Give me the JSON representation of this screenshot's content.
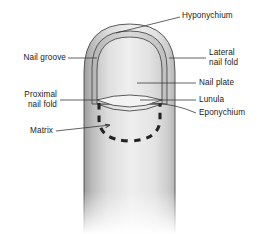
{
  "figure": {
    "title": "",
    "background_color": "#ffffff",
    "line_color": "#3a3a3a",
    "finger_fill_light": "#efefef",
    "finger_fill_mid": "#d5d5d5",
    "finger_fill_shadow": "#9a9a9a",
    "nail_plate_fill": "#e4e4e4",
    "lunula_fill": "#f2f2f2",
    "dashed_matrix_color": "#2b2b2b"
  },
  "labels": {
    "hyponychium": "Hyponychium",
    "nail_groove": "Nail groove",
    "lateral_nail_fold": "Lateral\nnail fold",
    "nail_plate": "Nail plate",
    "lunula": "Lunula",
    "eponychium": "Eponychium",
    "proximal_nail_fold": "Proximal\nnail fold",
    "matrix": "Matrix"
  },
  "label_list": [
    {
      "key": "hyponychium",
      "text": "Hyponychium",
      "side": "right"
    },
    {
      "key": "lateral_nail_fold",
      "text": "Lateral nail fold",
      "side": "right"
    },
    {
      "key": "nail_plate",
      "text": "Nail plate",
      "side": "right"
    },
    {
      "key": "lunula",
      "text": "Lunula",
      "side": "right"
    },
    {
      "key": "eponychium",
      "text": "Eponychium",
      "side": "right"
    },
    {
      "key": "nail_groove",
      "text": "Nail groove",
      "side": "left"
    },
    {
      "key": "proximal_nail_fold",
      "text": "Proximal nail fold",
      "side": "left"
    },
    {
      "key": "matrix",
      "text": "Matrix",
      "side": "left"
    }
  ]
}
